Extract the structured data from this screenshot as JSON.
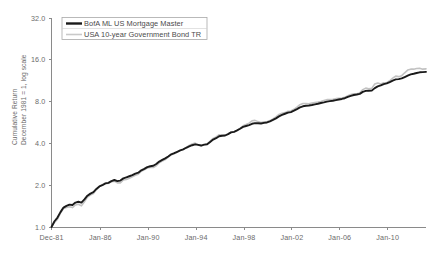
{
  "chart_data": {
    "type": "line",
    "title": "",
    "xlabel": "",
    "ylabel_line1": "Cumulative Return",
    "ylabel_line2": "December 1981 = 1, log scale",
    "yscale": "log2",
    "ylim": [
      1.0,
      32.0
    ],
    "ytick_labels": [
      "32.0",
      "16.0",
      "8.0",
      "4.0",
      "2.0",
      "1.0"
    ],
    "ytick_values": [
      32.0,
      16.0,
      8.0,
      4.0,
      2.0,
      1.0
    ],
    "xtick_labels": [
      "Dec-81",
      "Jan-86",
      "Jan-90",
      "Jan-94",
      "Jan-98",
      "Jan-02",
      "Jan-06",
      "Jan-10"
    ],
    "xtick_years": [
      1981.92,
      1986.0,
      1990.0,
      1994.0,
      1998.0,
      2002.0,
      2006.0,
      2010.0
    ],
    "xlim": [
      1981.92,
      2013.2
    ],
    "grid": false,
    "legend_position": "top-left",
    "legend": [
      {
        "label": "BofA ML US Mortgage Master",
        "color": "#1a1a1a",
        "style": "thick-solid"
      },
      {
        "label": "USA 10-year Government Bond TR",
        "color": "#c9c9c9",
        "style": "thin-solid"
      }
    ],
    "series": [
      {
        "name": "BofA ML US Mortgage Master",
        "color": "#1a1a1a",
        "x": [
          1981.92,
          1982.17,
          1982.42,
          1982.67,
          1982.92,
          1983.17,
          1983.42,
          1983.67,
          1983.92,
          1984.17,
          1984.42,
          1984.67,
          1984.92,
          1985.17,
          1985.42,
          1985.67,
          1985.92,
          1986.17,
          1986.42,
          1986.67,
          1986.92,
          1987.17,
          1987.42,
          1987.67,
          1987.92,
          1988.17,
          1988.42,
          1988.67,
          1988.92,
          1989.17,
          1989.42,
          1989.67,
          1989.92,
          1990.17,
          1990.42,
          1990.67,
          1990.92,
          1991.17,
          1991.42,
          1991.67,
          1991.92,
          1992.17,
          1992.42,
          1992.67,
          1992.92,
          1993.17,
          1993.42,
          1993.67,
          1993.92,
          1994.17,
          1994.42,
          1994.67,
          1994.92,
          1995.17,
          1995.42,
          1995.67,
          1995.92,
          1996.17,
          1996.42,
          1996.67,
          1996.92,
          1997.17,
          1997.42,
          1997.67,
          1997.92,
          1998.17,
          1998.42,
          1998.67,
          1998.92,
          1999.17,
          1999.42,
          1999.67,
          1999.92,
          2000.17,
          2000.42,
          2000.67,
          2000.92,
          2001.17,
          2001.42,
          2001.67,
          2001.92,
          2002.17,
          2002.42,
          2002.67,
          2002.92,
          2003.17,
          2003.42,
          2003.67,
          2003.92,
          2004.17,
          2004.42,
          2004.67,
          2004.92,
          2005.17,
          2005.42,
          2005.67,
          2005.92,
          2006.17,
          2006.42,
          2006.67,
          2006.92,
          2007.17,
          2007.42,
          2007.67,
          2007.92,
          2008.17,
          2008.42,
          2008.67,
          2008.92,
          2009.17,
          2009.42,
          2009.67,
          2009.92,
          2010.17,
          2010.42,
          2010.67,
          2010.92,
          2011.17,
          2011.42,
          2011.67,
          2011.92,
          2012.17,
          2012.42,
          2012.67,
          2012.92,
          2013.2
        ],
        "y": [
          1.0,
          1.1,
          1.17,
          1.28,
          1.38,
          1.42,
          1.45,
          1.44,
          1.5,
          1.52,
          1.5,
          1.58,
          1.68,
          1.74,
          1.78,
          1.88,
          1.96,
          2.0,
          2.06,
          2.08,
          2.14,
          2.18,
          2.14,
          2.16,
          2.24,
          2.28,
          2.32,
          2.36,
          2.42,
          2.46,
          2.56,
          2.62,
          2.7,
          2.74,
          2.76,
          2.84,
          2.96,
          3.04,
          3.12,
          3.22,
          3.34,
          3.4,
          3.48,
          3.56,
          3.62,
          3.72,
          3.8,
          3.88,
          3.94,
          3.9,
          3.86,
          3.92,
          3.94,
          4.1,
          4.26,
          4.36,
          4.5,
          4.54,
          4.56,
          4.66,
          4.8,
          4.84,
          4.96,
          5.1,
          5.26,
          5.34,
          5.42,
          5.54,
          5.6,
          5.58,
          5.56,
          5.62,
          5.66,
          5.76,
          5.9,
          6.06,
          6.26,
          6.42,
          6.54,
          6.66,
          6.72,
          6.88,
          7.06,
          7.26,
          7.4,
          7.46,
          7.5,
          7.56,
          7.64,
          7.72,
          7.82,
          7.9,
          8.0,
          8.06,
          8.12,
          8.2,
          8.28,
          8.36,
          8.46,
          8.64,
          8.8,
          8.92,
          9.0,
          9.1,
          9.4,
          9.56,
          9.58,
          9.6,
          10.0,
          10.3,
          10.46,
          10.7,
          10.82,
          11.06,
          11.34,
          11.56,
          11.62,
          11.76,
          12.02,
          12.3,
          12.56,
          12.7,
          12.86,
          13.0,
          13.04,
          13.1
        ]
      },
      {
        "name": "USA 10-year Government Bond TR",
        "color": "#c9c9c9",
        "x": [
          1981.92,
          1982.17,
          1982.42,
          1982.67,
          1982.92,
          1983.17,
          1983.42,
          1983.67,
          1983.92,
          1984.17,
          1984.42,
          1984.67,
          1984.92,
          1985.17,
          1985.42,
          1985.67,
          1985.92,
          1986.17,
          1986.42,
          1986.67,
          1986.92,
          1987.17,
          1987.42,
          1987.67,
          1987.92,
          1988.17,
          1988.42,
          1988.67,
          1988.92,
          1989.17,
          1989.42,
          1989.67,
          1989.92,
          1990.17,
          1990.42,
          1990.67,
          1990.92,
          1991.17,
          1991.42,
          1991.67,
          1991.92,
          1992.17,
          1992.42,
          1992.67,
          1992.92,
          1993.17,
          1993.42,
          1993.67,
          1993.92,
          1994.17,
          1994.42,
          1994.67,
          1994.92,
          1995.17,
          1995.42,
          1995.67,
          1995.92,
          1996.17,
          1996.42,
          1996.67,
          1996.92,
          1997.17,
          1997.42,
          1997.67,
          1997.92,
          1998.17,
          1998.42,
          1998.67,
          1998.92,
          1999.17,
          1999.42,
          1999.67,
          1999.92,
          2000.17,
          2000.42,
          2000.67,
          2000.92,
          2001.17,
          2001.42,
          2001.67,
          2001.92,
          2002.17,
          2002.42,
          2002.67,
          2002.92,
          2003.17,
          2003.42,
          2003.67,
          2003.92,
          2004.17,
          2004.42,
          2004.67,
          2004.92,
          2005.17,
          2005.42,
          2005.67,
          2005.92,
          2006.17,
          2006.42,
          2006.67,
          2006.92,
          2007.17,
          2007.42,
          2007.67,
          2007.92,
          2008.17,
          2008.42,
          2008.67,
          2008.92,
          2009.17,
          2009.42,
          2009.67,
          2009.92,
          2010.17,
          2010.42,
          2010.67,
          2010.92,
          2011.17,
          2011.42,
          2011.67,
          2011.92,
          2012.17,
          2012.42,
          2012.67,
          2012.92,
          2013.2
        ],
        "y": [
          1.0,
          1.08,
          1.14,
          1.26,
          1.36,
          1.38,
          1.4,
          1.38,
          1.44,
          1.46,
          1.42,
          1.52,
          1.64,
          1.7,
          1.74,
          1.86,
          1.96,
          2.02,
          2.06,
          2.06,
          2.12,
          2.14,
          2.08,
          2.08,
          2.18,
          2.2,
          2.24,
          2.3,
          2.36,
          2.4,
          2.52,
          2.58,
          2.66,
          2.68,
          2.68,
          2.76,
          2.9,
          2.98,
          3.06,
          3.18,
          3.32,
          3.36,
          3.46,
          3.56,
          3.62,
          3.74,
          3.86,
          3.96,
          4.02,
          3.92,
          3.84,
          3.9,
          3.94,
          4.16,
          4.34,
          4.46,
          4.62,
          4.6,
          4.56,
          4.68,
          4.84,
          4.84,
          4.96,
          5.14,
          5.36,
          5.48,
          5.6,
          5.82,
          5.86,
          5.74,
          5.66,
          5.72,
          5.72,
          5.84,
          6.0,
          6.2,
          6.46,
          6.6,
          6.66,
          6.82,
          6.84,
          7.04,
          7.3,
          7.6,
          7.76,
          7.76,
          7.72,
          7.8,
          7.88,
          7.94,
          8.02,
          8.14,
          8.26,
          8.28,
          8.3,
          8.4,
          8.46,
          8.5,
          8.58,
          8.82,
          9.0,
          9.1,
          9.12,
          9.24,
          9.76,
          10.0,
          9.9,
          9.96,
          10.7,
          10.9,
          10.7,
          10.94,
          10.96,
          11.3,
          11.8,
          12.2,
          12.1,
          12.3,
          12.9,
          13.5,
          13.7,
          13.7,
          13.86,
          13.9,
          13.7,
          13.76
        ]
      }
    ]
  }
}
